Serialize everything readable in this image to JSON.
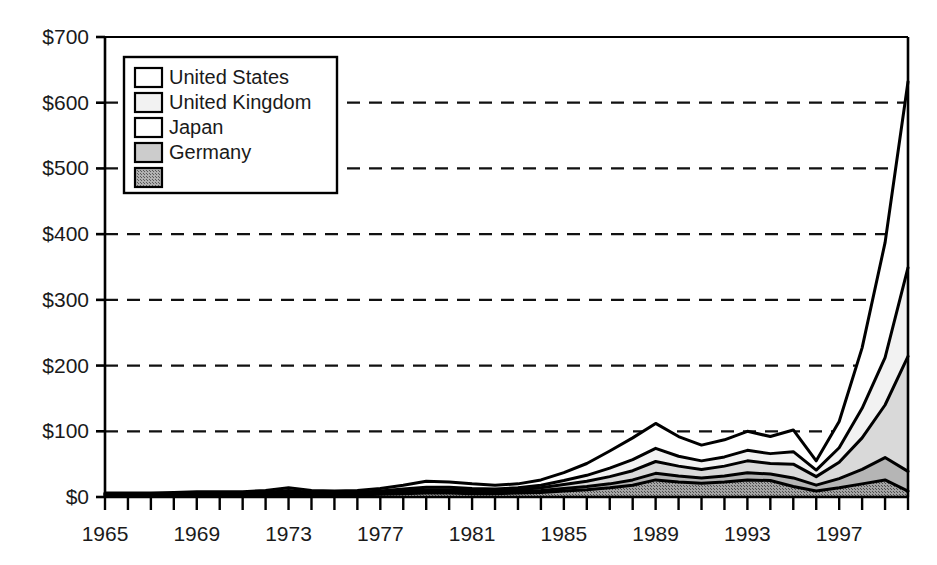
{
  "chart_data": {
    "type": "area",
    "stacked": true,
    "title": "",
    "subtitle": "",
    "xlabel": "",
    "ylabel": "",
    "xlim": [
      1965,
      2000
    ],
    "ylim": [
      0,
      700
    ],
    "y_tick_values": [
      0,
      100,
      200,
      300,
      400,
      500,
      600,
      700
    ],
    "y_tick_labels": [
      "$0",
      "$100",
      "$200",
      "$300",
      "$400",
      "$500",
      "$600",
      "$700"
    ],
    "x_tick_labels": [
      "1965",
      "1969",
      "1973",
      "1977",
      "1981",
      "1985",
      "1989",
      "1993",
      "1997"
    ],
    "x_tick_label_values": [
      1965,
      1969,
      1973,
      1977,
      1981,
      1985,
      1989,
      1993,
      1997
    ],
    "x_minor_tick_interval": 1,
    "grid": "horizontal-dashed",
    "legend_position": "top-left-inside",
    "x": [
      1965,
      1966,
      1967,
      1968,
      1969,
      1970,
      1971,
      1972,
      1973,
      1974,
      1975,
      1976,
      1977,
      1978,
      1979,
      1980,
      1981,
      1982,
      1983,
      1984,
      1985,
      1986,
      1987,
      1988,
      1989,
      1990,
      1991,
      1992,
      1993,
      1994,
      1995,
      1996,
      1997,
      1998,
      1999,
      2000
    ],
    "series": [
      {
        "name": "United States",
        "fill": "#ffffff",
        "values": [
          1,
          1,
          1,
          2,
          2,
          2,
          2,
          3,
          4,
          3,
          2,
          3,
          4,
          6,
          9,
          8,
          7,
          6,
          6,
          8,
          12,
          18,
          26,
          33,
          38,
          30,
          24,
          26,
          29,
          26,
          33,
          14,
          40,
          92,
          175,
          283
        ]
      },
      {
        "name": "United Kingdom",
        "fill": "#f2f2f2",
        "values": [
          1,
          1,
          1,
          1,
          1,
          1,
          1,
          2,
          3,
          2,
          2,
          2,
          2,
          3,
          4,
          4,
          3,
          3,
          3,
          4,
          6,
          9,
          13,
          17,
          20,
          15,
          13,
          14,
          16,
          15,
          19,
          10,
          22,
          45,
          72,
          135
        ]
      },
      {
        "name": "Japan",
        "fill": "#d9d9d9",
        "values": [
          1,
          1,
          1,
          1,
          1,
          1,
          1,
          1,
          2,
          1,
          1,
          1,
          2,
          2,
          3,
          3,
          3,
          2,
          3,
          4,
          6,
          8,
          11,
          14,
          18,
          15,
          13,
          15,
          18,
          16,
          21,
          13,
          25,
          48,
          80,
          175
        ]
      },
      {
        "name": "Germany",
        "fill": "#b5b5b5",
        "values": [
          1,
          1,
          1,
          1,
          1,
          1,
          1,
          1,
          1,
          1,
          1,
          1,
          1,
          2,
          2,
          2,
          2,
          2,
          2,
          3,
          4,
          5,
          6,
          8,
          10,
          9,
          8,
          9,
          11,
          10,
          13,
          9,
          14,
          22,
          34,
          30
        ]
      },
      {
        "name": "",
        "fill": "#8f8f8f",
        "values": [
          2,
          2,
          2,
          2,
          3,
          3,
          3,
          3,
          4,
          3,
          3,
          3,
          4,
          5,
          6,
          6,
          5,
          5,
          6,
          7,
          9,
          11,
          14,
          18,
          26,
          23,
          21,
          23,
          26,
          25,
          16,
          9,
          14,
          20,
          26,
          9
        ]
      }
    ],
    "totals": [
      6,
      6,
      6,
      7,
      8,
      8,
      8,
      10,
      14,
      10,
      9,
      10,
      13,
      18,
      24,
      23,
      20,
      18,
      20,
      26,
      37,
      51,
      70,
      90,
      112,
      92,
      79,
      87,
      100,
      92,
      102,
      55,
      115,
      227,
      387,
      632
    ],
    "legend_items": [
      {
        "label": "United States",
        "swatch": "#ffffff"
      },
      {
        "label": "United Kingdom",
        "swatch": "#f2f2f2"
      },
      {
        "label": "Japan",
        "swatch": "#ffffff"
      },
      {
        "label": "Germany",
        "swatch": "#cccccc"
      },
      {
        "label": "",
        "swatch": "#9a9a9a"
      }
    ]
  }
}
